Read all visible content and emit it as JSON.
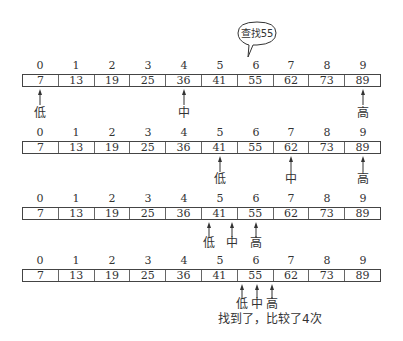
{
  "diagram": {
    "title_bubble": "查找55",
    "indices": [
      "0",
      "1",
      "2",
      "3",
      "4",
      "5",
      "6",
      "7",
      "8",
      "9"
    ],
    "values": [
      "7",
      "13",
      "19",
      "25",
      "36",
      "41",
      "55",
      "62",
      "73",
      "89"
    ],
    "labels": {
      "low": "低",
      "mid": "中",
      "high": "高"
    },
    "steps": [
      {
        "step": 1,
        "low_index": 0,
        "mid_index": 4,
        "high_index": 9
      },
      {
        "step": 2,
        "low_index": 5,
        "mid_index": 7,
        "high_index": 9
      },
      {
        "step": 3,
        "low_index": 5,
        "mid_index": 6,
        "high_index": 6
      },
      {
        "step": 4,
        "low_index": 6,
        "mid_index": 6,
        "high_index": 6
      }
    ],
    "result_caption": "找到了，比较了4次"
  }
}
